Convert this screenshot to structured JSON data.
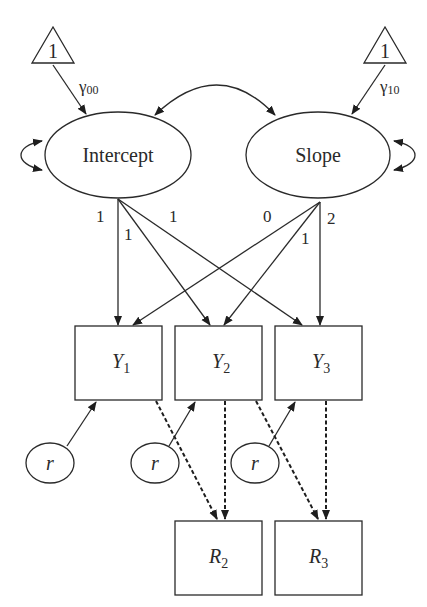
{
  "diagram": {
    "type": "latent growth curve model path diagram",
    "constants": [
      {
        "id": "const-intercept",
        "label": "1",
        "path_label": "γ",
        "path_sub": "00"
      },
      {
        "id": "const-slope",
        "label": "1",
        "path_label": "γ",
        "path_sub": "10"
      }
    ],
    "latents": [
      {
        "id": "intercept",
        "label": "Intercept"
      },
      {
        "id": "slope",
        "label": "Slope"
      }
    ],
    "loadings": {
      "intercept": [
        "1",
        "1",
        "1"
      ],
      "slope": [
        "0",
        "1",
        "2"
      ]
    },
    "observed": [
      {
        "id": "Y1",
        "main": "Y",
        "sub": "1"
      },
      {
        "id": "Y2",
        "main": "Y",
        "sub": "2"
      },
      {
        "id": "Y3",
        "main": "Y",
        "sub": "3"
      }
    ],
    "residuals": [
      {
        "id": "r1",
        "label": "r"
      },
      {
        "id": "r2",
        "label": "r"
      },
      {
        "id": "r3",
        "label": "r"
      }
    ],
    "missingness": [
      {
        "id": "R2",
        "main": "R",
        "sub": "2"
      },
      {
        "id": "R3",
        "main": "R",
        "sub": "3"
      }
    ]
  }
}
